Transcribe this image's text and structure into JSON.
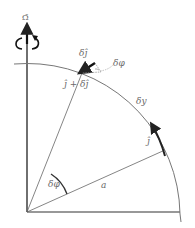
{
  "labels": {
    "omega": "Ω̄",
    "delta_j": "δĵ",
    "delta_phi_top": "δφ",
    "j_plus_delta_j": "ĵ + δĵ",
    "delta_y": "δy",
    "j": "ĵ",
    "delta_phi_angle": "δφ",
    "radius": "a"
  },
  "colors": {
    "line": "#555555",
    "arrow": "#222222",
    "text": "#6a6a6a"
  }
}
